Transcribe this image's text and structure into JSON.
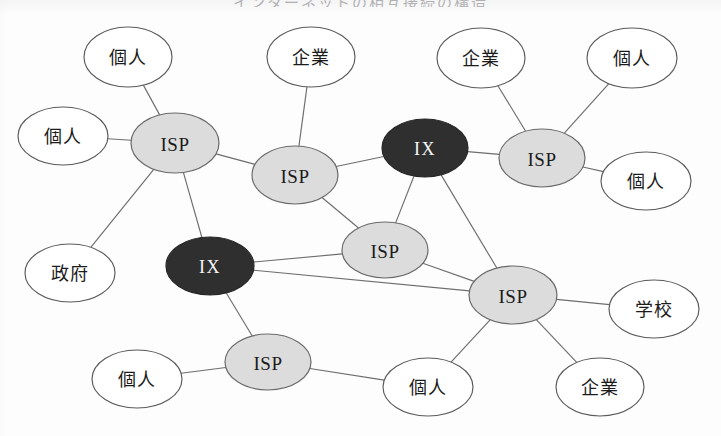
{
  "figure": {
    "cropped_caption_fragment": "インターネットの相互接続の構造",
    "kind": "network-topology-diagram",
    "colors": {
      "leaf_fill": "#ffffff",
      "isp_fill": "#dcdcdc",
      "ix_fill": "#2f2f2f",
      "edge_stroke": "#6d6d6d",
      "leaf_text": "#1b1b1b",
      "ix_text": "#f6f6f6",
      "background": "#fdfdfd"
    },
    "legend_terms": {
      "isp": "ISP",
      "ix": "IX",
      "kojin": "個人",
      "kigyou": "企業",
      "seifu": "政府",
      "gakkou": "学校"
    }
  },
  "chart_data": {
    "type": "diagram",
    "title": "",
    "nodes": [
      {
        "id": "kojin-top-left",
        "label": "個人",
        "type": "leaf",
        "cx": 128,
        "cy": 57,
        "rx": 44,
        "ry": 30
      },
      {
        "id": "kojin-far-left",
        "label": "個人",
        "type": "leaf",
        "cx": 63,
        "cy": 136,
        "rx": 45,
        "ry": 29
      },
      {
        "id": "seifu-left",
        "label": "政府",
        "type": "leaf",
        "cx": 70,
        "cy": 273,
        "rx": 45,
        "ry": 29
      },
      {
        "id": "kigyou-top-mid",
        "label": "企業",
        "type": "leaf",
        "cx": 311,
        "cy": 57,
        "rx": 44,
        "ry": 30
      },
      {
        "id": "kigyou-top-right",
        "label": "企業",
        "type": "leaf",
        "cx": 481,
        "cy": 58,
        "rx": 44,
        "ry": 30
      },
      {
        "id": "kojin-top-far-right",
        "label": "個人",
        "type": "leaf",
        "cx": 632,
        "cy": 58,
        "rx": 45,
        "ry": 30
      },
      {
        "id": "kojin-right",
        "label": "個人",
        "type": "leaf",
        "cx": 646,
        "cy": 181,
        "rx": 45,
        "ry": 29
      },
      {
        "id": "gakkou-right",
        "label": "学校",
        "type": "leaf",
        "cx": 654,
        "cy": 309,
        "rx": 45,
        "ry": 29
      },
      {
        "id": "kigyou-bottom-right",
        "label": "企業",
        "type": "leaf",
        "cx": 600,
        "cy": 387,
        "rx": 44,
        "ry": 29
      },
      {
        "id": "kojin-bottom-mid",
        "label": "個人",
        "type": "leaf",
        "cx": 428,
        "cy": 387,
        "rx": 45,
        "ry": 29
      },
      {
        "id": "kojin-bottom-left",
        "label": "個人",
        "type": "leaf",
        "cx": 137,
        "cy": 379,
        "rx": 45,
        "ry": 29
      },
      {
        "id": "isp-top-left",
        "label": "ISP",
        "type": "isp",
        "cx": 175,
        "cy": 143,
        "rx": 44,
        "ry": 30
      },
      {
        "id": "isp-upper-mid",
        "label": "ISP",
        "type": "isp",
        "cx": 295,
        "cy": 175,
        "rx": 43,
        "ry": 29
      },
      {
        "id": "isp-top-right",
        "label": "ISP",
        "type": "isp",
        "cx": 542,
        "cy": 158,
        "rx": 43,
        "ry": 29
      },
      {
        "id": "isp-center",
        "label": "ISP",
        "type": "isp",
        "cx": 385,
        "cy": 250,
        "rx": 43,
        "ry": 28
      },
      {
        "id": "isp-right",
        "label": "ISP",
        "type": "isp",
        "cx": 513,
        "cy": 295,
        "rx": 44,
        "ry": 29
      },
      {
        "id": "isp-bottom",
        "label": "ISP",
        "type": "isp",
        "cx": 268,
        "cy": 362,
        "rx": 43,
        "ry": 28
      },
      {
        "id": "ix-top",
        "label": "IX",
        "type": "ix",
        "cx": 425,
        "cy": 148,
        "rx": 43,
        "ry": 29
      },
      {
        "id": "ix-left",
        "label": "IX",
        "type": "ix",
        "cx": 210,
        "cy": 266,
        "rx": 44,
        "ry": 29
      }
    ],
    "edges": [
      {
        "from": "kojin-top-left",
        "to": "isp-top-left"
      },
      {
        "from": "kojin-far-left",
        "to": "isp-top-left"
      },
      {
        "from": "seifu-left",
        "to": "isp-top-left"
      },
      {
        "from": "isp-top-left",
        "to": "isp-upper-mid"
      },
      {
        "from": "isp-top-left",
        "to": "ix-left"
      },
      {
        "from": "kigyou-top-mid",
        "to": "isp-upper-mid"
      },
      {
        "from": "isp-upper-mid",
        "to": "ix-top"
      },
      {
        "from": "isp-upper-mid",
        "to": "isp-center"
      },
      {
        "from": "kigyou-top-right",
        "to": "isp-top-right"
      },
      {
        "from": "kojin-top-far-right",
        "to": "isp-top-right"
      },
      {
        "from": "kojin-right",
        "to": "isp-top-right"
      },
      {
        "from": "ix-top",
        "to": "isp-top-right"
      },
      {
        "from": "ix-top",
        "to": "isp-center"
      },
      {
        "from": "ix-top",
        "to": "isp-right"
      },
      {
        "from": "ix-left",
        "to": "isp-center"
      },
      {
        "from": "ix-left",
        "to": "isp-right"
      },
      {
        "from": "ix-left",
        "to": "isp-bottom"
      },
      {
        "from": "isp-center",
        "to": "isp-right"
      },
      {
        "from": "isp-right",
        "to": "gakkou-right"
      },
      {
        "from": "isp-right",
        "to": "kigyou-bottom-right"
      },
      {
        "from": "isp-right",
        "to": "kojin-bottom-mid"
      },
      {
        "from": "isp-bottom",
        "to": "kojin-bottom-left"
      },
      {
        "from": "isp-bottom",
        "to": "kojin-bottom-mid"
      }
    ]
  }
}
